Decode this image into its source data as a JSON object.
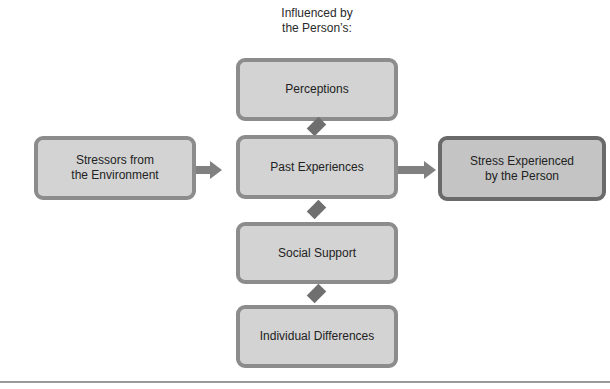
{
  "caption": {
    "line1": "Influenced by",
    "line2": "the Person’s:"
  },
  "boxes": {
    "left": {
      "line1": "Stressors from",
      "line2": "the Environment"
    },
    "perceptions": "Perceptions",
    "past_experiences": "Past Experiences",
    "social_support": "Social Support",
    "individual_differences": "Individual Differences",
    "right": {
      "line1": "Stress Experienced",
      "line2": "by the Person"
    }
  },
  "colors": {
    "box_fill": "#d3d3d3",
    "box_border": "#8c8c8c",
    "connector": "#808080",
    "outcome_border": "#6a6a6a"
  }
}
